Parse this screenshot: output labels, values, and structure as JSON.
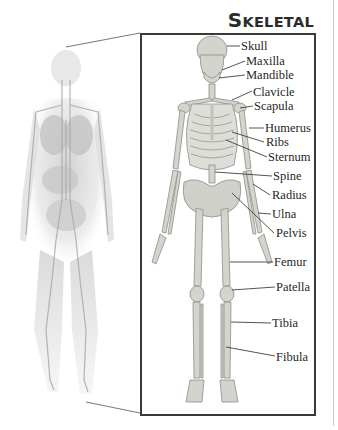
{
  "title": {
    "first_cap": "S",
    "first_rest": "KELETAL",
    "second_cap": "S",
    "second_rest": "YSTEM",
    "full": "Skeletal System"
  },
  "figure": {
    "left_illustration": "translucent-human-body-circulatory-system",
    "right_illustration": "front-view-human-skeleton",
    "frame_color": "#3a3a3a",
    "bone_color": "#d4d4cf",
    "labels": [
      {
        "name": "skull",
        "text": "Skull"
      },
      {
        "name": "maxilla",
        "text": "Maxilla"
      },
      {
        "name": "mandible",
        "text": "Mandible"
      },
      {
        "name": "clavicle",
        "text": "Clavicle"
      },
      {
        "name": "scapula",
        "text": "Scapula"
      },
      {
        "name": "humerus",
        "text": "Humerus"
      },
      {
        "name": "ribs",
        "text": "Ribs"
      },
      {
        "name": "sternum",
        "text": "Sternum"
      },
      {
        "name": "spine",
        "text": "Spine"
      },
      {
        "name": "radius",
        "text": "Radius"
      },
      {
        "name": "ulna",
        "text": "Ulna"
      },
      {
        "name": "pelvis",
        "text": "Pelvis"
      },
      {
        "name": "femur",
        "text": "Femur"
      },
      {
        "name": "patella",
        "text": "Patella"
      },
      {
        "name": "tibia",
        "text": "Tibia"
      },
      {
        "name": "fibula",
        "text": "Fibula"
      }
    ]
  }
}
